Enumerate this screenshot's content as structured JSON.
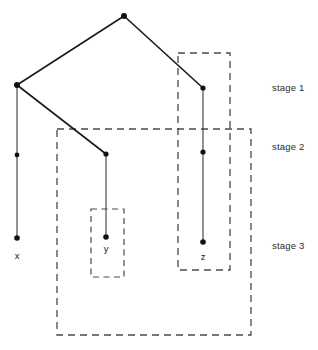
{
  "diagram": {
    "colors": {
      "line": "#1a1a1a",
      "node": "#111111",
      "dashed": "#4a4a4a",
      "background": "#ffffff",
      "text": "#2b2b2b"
    },
    "nodes": [
      {
        "id": "root",
        "x": 124,
        "y": 16,
        "r": 3.0,
        "label": ""
      },
      {
        "id": "left",
        "x": 17,
        "y": 85,
        "r": 3.0,
        "label": ""
      },
      {
        "id": "zbranch",
        "x": 203,
        "y": 88,
        "r": 2.6,
        "label": ""
      },
      {
        "id": "xmid",
        "x": 17,
        "y": 155,
        "r": 2.4,
        "label": ""
      },
      {
        "id": "ybranch",
        "x": 106,
        "y": 154,
        "r": 2.6,
        "label": ""
      },
      {
        "id": "zmid",
        "x": 203,
        "y": 152,
        "r": 2.6,
        "label": ""
      },
      {
        "id": "xleaf",
        "x": 17,
        "y": 238,
        "r": 2.8,
        "label": "x"
      },
      {
        "id": "yleaf",
        "x": 106,
        "y": 237,
        "r": 2.8,
        "label": "y"
      },
      {
        "id": "zleaf",
        "x": 203,
        "y": 242,
        "r": 2.8,
        "label": "z"
      }
    ],
    "edges": [
      {
        "id": "root-left",
        "x1": 124,
        "y1": 16,
        "x2": 17,
        "y2": 85
      },
      {
        "id": "root-zbranch",
        "x1": 124,
        "y1": 16,
        "x2": 203,
        "y2": 88
      },
      {
        "id": "left-xspine",
        "x1": 17,
        "y1": 85,
        "x2": 17,
        "y2": 238
      },
      {
        "id": "left-ybranch",
        "x1": 17,
        "y1": 85,
        "x2": 106,
        "y2": 154
      },
      {
        "id": "ybranch-yleaf",
        "x1": 106,
        "y1": 154,
        "x2": 106,
        "y2": 237
      },
      {
        "id": "zbranch-zleaf",
        "x1": 203,
        "y1": 88,
        "x2": 203,
        "y2": 242
      }
    ],
    "leaf_labels": [
      {
        "id": "label-x",
        "text": "x",
        "x": 17,
        "y": 259
      },
      {
        "id": "label-y",
        "text": "y",
        "x": 106,
        "y": 252
      },
      {
        "id": "label-z",
        "text": "z",
        "x": 203,
        "y": 260
      }
    ],
    "dashed_boxes": [
      {
        "id": "box-z",
        "x": 178,
        "y": 53,
        "width": 52,
        "height": 217
      },
      {
        "id": "box-large",
        "x": 57,
        "y": 129,
        "width": 194,
        "height": 206
      },
      {
        "id": "box-y",
        "x": 91,
        "y": 209,
        "width": 33,
        "height": 68
      }
    ],
    "stage_labels": [
      {
        "id": "stage-1",
        "text": "stage 1",
        "x": 272,
        "y": 82
      },
      {
        "id": "stage-2",
        "text": "stage 2",
        "x": 272,
        "y": 141
      },
      {
        "id": "stage-3",
        "text": "stage 3",
        "x": 272,
        "y": 240
      }
    ]
  }
}
